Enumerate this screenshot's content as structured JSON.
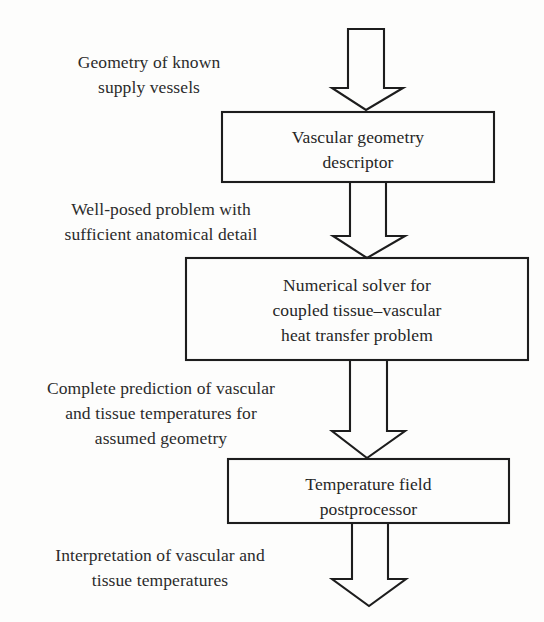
{
  "diagram": {
    "stroke_color": "#1d1d1d",
    "text_color": "#2b2b2b",
    "background_color": "#fdfdfc",
    "boxes": [
      {
        "id": "vascular-geometry-descriptor",
        "label": "Vascular geometry\ndescriptor"
      },
      {
        "id": "numerical-solver",
        "label": "Numerical solver for\ncoupled tissue–vascular\nheat transfer problem"
      },
      {
        "id": "temperature-field-postprocessor",
        "label": "Temperature field\npostprocessor"
      }
    ],
    "annotations": [
      {
        "id": "input-annotation",
        "label": "Geometry of known\nsupply vessels"
      },
      {
        "id": "well-posed-annotation",
        "label": "Well-posed problem with\nsufficient anatomical detail"
      },
      {
        "id": "prediction-annotation",
        "label": "Complete prediction of vascular\nand tissue temperatures for\nassumed geometry"
      },
      {
        "id": "interpretation-annotation",
        "label": "Interpretation of vascular and\ntissue temperatures"
      }
    ],
    "arrows": [
      {
        "id": "arrow-input-to-descriptor"
      },
      {
        "id": "arrow-descriptor-to-solver"
      },
      {
        "id": "arrow-solver-to-postprocessor"
      },
      {
        "id": "arrow-postprocessor-output"
      }
    ]
  }
}
